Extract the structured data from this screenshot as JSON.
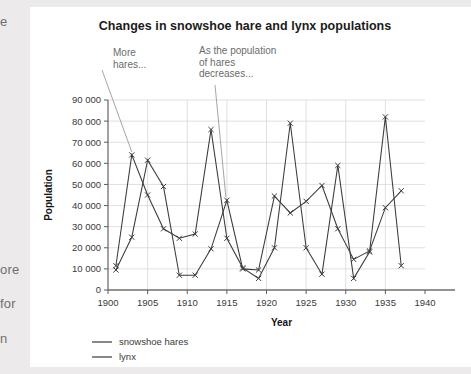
{
  "page": {
    "background_color": "#eceaea",
    "panel_color": "#ffffff",
    "margin_fragments": [
      "e",
      "ore",
      "for",
      "n"
    ]
  },
  "chart_data": {
    "type": "line",
    "title": "Changes in snowshoe hare and lynx populations",
    "xlabel": "Year",
    "ylabel": "Population",
    "xlim": [
      1900,
      1940
    ],
    "ylim": [
      0,
      90000
    ],
    "xticks": [
      1900,
      1905,
      1910,
      1915,
      1920,
      1925,
      1930,
      1935,
      1940
    ],
    "xticklabels": [
      "1900",
      "1905",
      "1910",
      "1915",
      "1920",
      "1925",
      "1930",
      "1935",
      "1940"
    ],
    "yticks": [
      0,
      10000,
      20000,
      30000,
      40000,
      50000,
      60000,
      70000,
      80000,
      90000
    ],
    "yticklabels": [
      "0",
      "10 000",
      "20 000",
      "30 000",
      "40 000",
      "50 000",
      "60 000",
      "70 000",
      "80 000",
      "90 000"
    ],
    "grid": true,
    "legend_position": "below-left",
    "marker": "x",
    "line_color": "#3b3b3b",
    "grid_color": "#d2d2d2",
    "series": [
      {
        "name": "snowshoe hares",
        "x": [
          1901,
          1903,
          1905,
          1907,
          1909,
          1911,
          1913,
          1915,
          1917,
          1919,
          1921,
          1923,
          1925,
          1927,
          1929,
          1931,
          1933,
          1935,
          1937
        ],
        "values": [
          11500,
          64000,
          45000,
          29000,
          24500,
          26500,
          76000,
          24500,
          10500,
          5500,
          20000,
          79000,
          20000,
          7500,
          59000,
          5500,
          18000,
          82000,
          11500
        ]
      },
      {
        "name": "lynx",
        "x": [
          1901,
          1903,
          1905,
          1907,
          1909,
          1911,
          1913,
          1915,
          1917,
          1919,
          1921,
          1923,
          1925,
          1927,
          1929,
          1931,
          1933,
          1935,
          1937
        ],
        "values": [
          9500,
          25000,
          61500,
          49000,
          7000,
          7000,
          19500,
          42500,
          10000,
          9500,
          44500,
          36500,
          42000,
          49500,
          29000,
          14500,
          18500,
          39000,
          47000
        ]
      }
    ],
    "annotations": [
      {
        "id": "more-hares",
        "text": "More\nhares...",
        "target_x": 1903,
        "target_y": 64000
      },
      {
        "id": "hares-decrease",
        "text": "As the population\nof hares\ndecreases...",
        "target_x": 1915,
        "target_y": 90000
      }
    ],
    "legend": [
      {
        "label": "snowshoe hares",
        "color": "#3b3b3b"
      },
      {
        "label": "lynx",
        "color": "#3b3b3b"
      }
    ]
  }
}
